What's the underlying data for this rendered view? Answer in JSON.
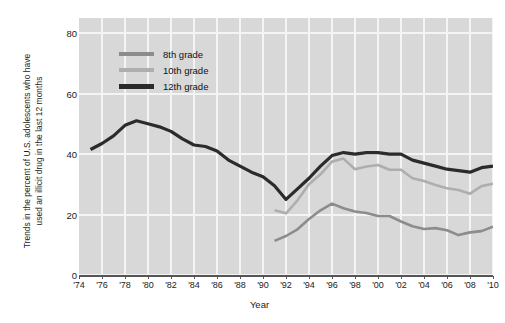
{
  "chart_data": {
    "type": "line",
    "title": "",
    "subtitle": "",
    "xlabel": "Year",
    "ylabel": "Trends in the percent of U.S. adolescents who have used an illicit drug in the last 12 months",
    "ylabel_lines": [
      "Trends in the percent of U.S. adolescents who have",
      "used an illicit drug in the last 12 months"
    ],
    "xlim": [
      1974,
      2010
    ],
    "ylim": [
      0,
      85
    ],
    "yticks": [
      0,
      20,
      40,
      60,
      80
    ],
    "ytick_labels": [
      "0",
      "20",
      "40",
      "60",
      "80"
    ],
    "xticks": [
      1974,
      1976,
      1978,
      1980,
      1982,
      1984,
      1986,
      1988,
      1990,
      1992,
      1994,
      1996,
      1998,
      2000,
      2002,
      2004,
      2006,
      2008,
      2010
    ],
    "xtick_labels": [
      "'74",
      "'76",
      "'78",
      "'80",
      "'82",
      "'84",
      "'86",
      "'88",
      "'90",
      "'92",
      "'94",
      "'96",
      "'98",
      "'00",
      "'02",
      "'04",
      "'06",
      "'08",
      "'10"
    ],
    "grid": true,
    "grid_color": "#f4f4f4",
    "plot_background": "#d8d8d8",
    "legend_position": "top-left-inside",
    "series": [
      {
        "name": "8th grade",
        "color": "#8c8c8c",
        "width": 2.6,
        "x": [
          1991,
          1992,
          1993,
          1994,
          1995,
          1996,
          1997,
          1998,
          1999,
          2000,
          2001,
          2002,
          2003,
          2004,
          2005,
          2006,
          2007,
          2008,
          2009,
          2010
        ],
        "values": [
          11.3,
          12.9,
          15.1,
          18.5,
          21.4,
          23.6,
          22.1,
          21.0,
          20.5,
          19.5,
          19.5,
          17.7,
          16.1,
          15.2,
          15.5,
          14.8,
          13.2,
          14.1,
          14.5,
          16.0
        ]
      },
      {
        "name": "10th grade",
        "color": "#aeaeae",
        "width": 2.6,
        "x": [
          1991,
          1992,
          1993,
          1994,
          1995,
          1996,
          1997,
          1998,
          1999,
          2000,
          2001,
          2002,
          2003,
          2004,
          2005,
          2006,
          2007,
          2008,
          2009,
          2010
        ],
        "values": [
          21.4,
          20.4,
          24.7,
          30.0,
          33.3,
          37.5,
          38.5,
          35.0,
          35.9,
          36.4,
          34.8,
          34.8,
          32.0,
          31.1,
          29.8,
          28.7,
          28.1,
          26.9,
          29.4,
          30.2
        ]
      },
      {
        "name": "12th grade",
        "color": "#2b2b2b",
        "width": 3.2,
        "x": [
          1975,
          1976,
          1977,
          1978,
          1979,
          1980,
          1981,
          1982,
          1983,
          1984,
          1985,
          1986,
          1987,
          1988,
          1989,
          1990,
          1991,
          1992,
          1993,
          1994,
          1995,
          1996,
          1997,
          1998,
          1999,
          2000,
          2001,
          2002,
          2003,
          2004,
          2005,
          2006,
          2007,
          2008,
          2009,
          2010
        ],
        "values": [
          41.5,
          43.5,
          46.0,
          49.5,
          51.0,
          50.0,
          49.0,
          47.5,
          45.0,
          43.0,
          42.5,
          41.0,
          38.0,
          36.0,
          34.0,
          32.5,
          29.5,
          25.0,
          28.5,
          32.0,
          36.0,
          39.5,
          40.5,
          40.0,
          40.5,
          40.5,
          40.0,
          40.0,
          38.0,
          37.0,
          36.0,
          35.0,
          34.5,
          34.0,
          35.5,
          36.0
        ]
      }
    ]
  },
  "legend": {
    "entries": [
      {
        "label": "8th grade",
        "color": "#8c8c8c"
      },
      {
        "label": "10th grade",
        "color": "#aeaeae"
      },
      {
        "label": "12th grade",
        "color": "#2b2b2b"
      }
    ]
  },
  "axes": {
    "x_title": "Year",
    "y_title_line1": "Trends in the percent of U.S. adolescents who have",
    "y_title_line2": "used an illicit drug in the last 12 months"
  }
}
